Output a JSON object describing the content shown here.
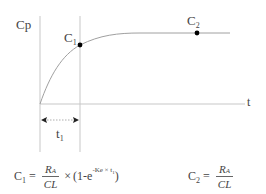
{
  "diagram": {
    "y_axis_label": "Cp",
    "x_axis_label": "t",
    "points": [
      {
        "label": "C",
        "subscript": "1",
        "x": 80,
        "y": 45
      },
      {
        "label": "C",
        "subscript": "2",
        "x": 197,
        "y": 33
      }
    ],
    "interval": {
      "label": "t",
      "subscript": "1"
    },
    "colors": {
      "axis": "#c8c8c8",
      "curve": "#9a9a9a",
      "point": "#000000",
      "text": "#444444"
    }
  },
  "formulas": {
    "c1": {
      "lhs": "C",
      "lhs_sub": "1",
      "eq": "=",
      "numerator": "R",
      "numerator_sub": "A",
      "denominator": "CL",
      "times": "×",
      "paren_open": "(1-e",
      "exponent": "-Ke × t",
      "exponent_sub": "1",
      "paren_close": ")"
    },
    "c2": {
      "lhs": "C",
      "lhs_sub": "2",
      "eq": "=",
      "numerator": "R",
      "numerator_sub": "A",
      "denominator": "CL"
    }
  }
}
